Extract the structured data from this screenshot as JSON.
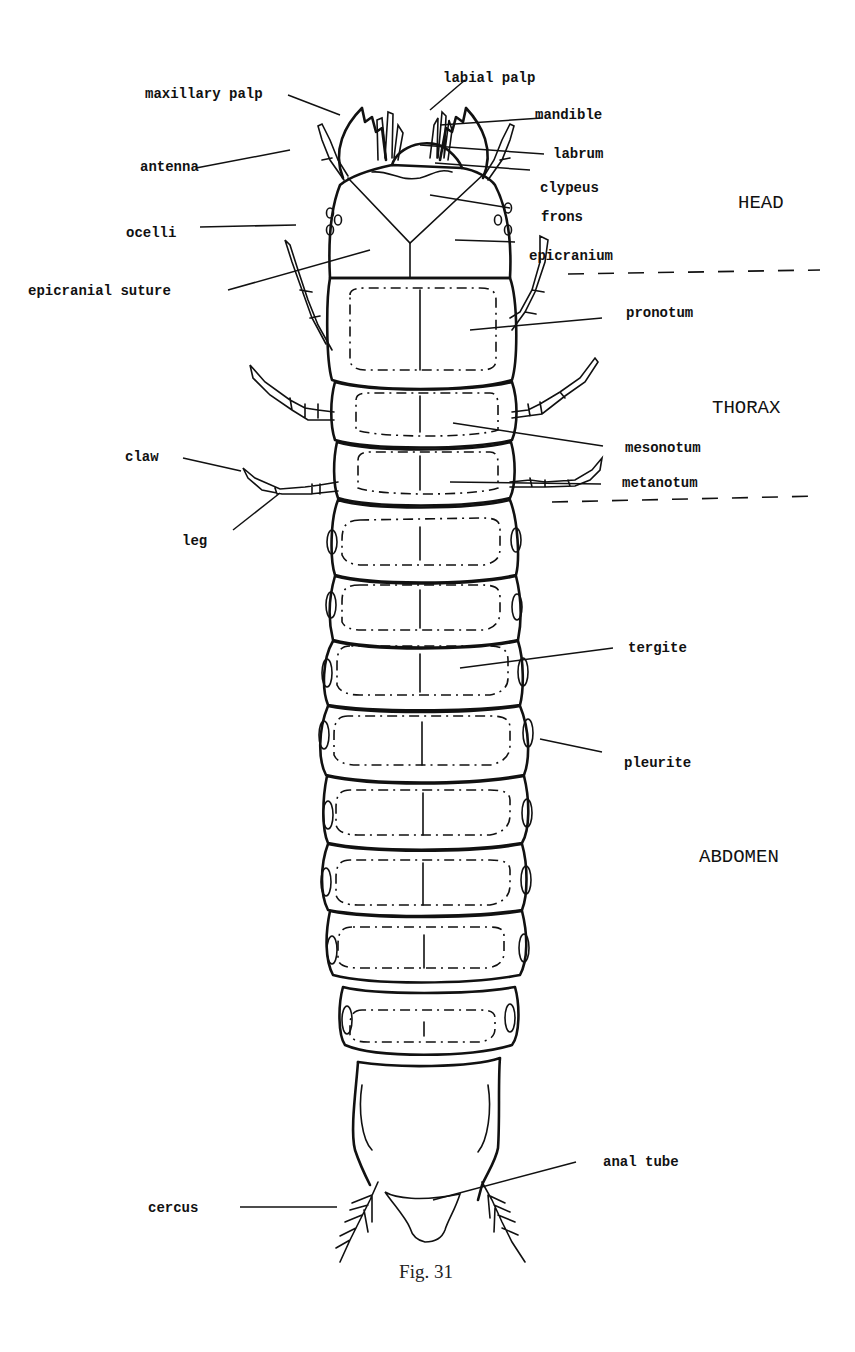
{
  "figure": {
    "caption": "Fig. 31",
    "regions": {
      "head": "HEAD",
      "thorax": "THORAX",
      "abdomen": "ABDOMEN"
    },
    "labels": {
      "maxillary_palp": "maxillary palp",
      "labial_palp": "labial palp",
      "mandible": "mandible",
      "antenna": "antenna",
      "labrum": "labrum",
      "clypeus": "clypeus",
      "ocelli": "ocelli",
      "frons": "frons",
      "epicranium": "epicranium",
      "epicranial_suture": "epicranial suture",
      "pronotum": "pronotum",
      "mesonotum": "mesonotum",
      "metanotum": "metanotum",
      "claw": "claw",
      "leg": "leg",
      "tergite": "tergite",
      "pleurite": "pleurite",
      "anal_tube": "anal tube",
      "cercus": "cercus"
    },
    "abdominal_segment_count": 9
  }
}
